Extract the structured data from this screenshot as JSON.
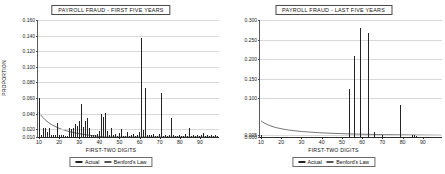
{
  "figure": {
    "background": "#ffffff",
    "series_color": "#242424",
    "grid_color": "#d9d9d9"
  },
  "charts": [
    {
      "id": "payroll-fraud-first-five-years",
      "title": "PAYROLL FRAUD - FIRST FIVE YEARS",
      "xlabel": "FIRST-TWO DIGITS",
      "ylabel": "PROPORTION",
      "legend": {
        "actual": "Actual",
        "benford": "Benford's Law",
        "position": "below-axis"
      },
      "yticks": [
        "0.160",
        "0.140",
        "0.120",
        "0.100",
        "0.080",
        "0.060",
        "0.040",
        "0.020",
        "0.010"
      ],
      "xticks": [
        "10",
        "20",
        "30",
        "40",
        "50",
        "60",
        "70",
        "80",
        "90"
      ]
    },
    {
      "id": "payroll-fraud-last-five-years",
      "title": "PAYROLL FRAUD - LAST FIVE YEARS",
      "xlabel": "FIRST-TWO DIGITS",
      "ylabel": "",
      "legend": {
        "actual": "Actual",
        "benford": "Benford's Law",
        "position": "below-axis"
      },
      "yticks": [
        "0.300",
        "0.250",
        "0.200",
        "0.150",
        "0.100",
        "0.005",
        "0.000"
      ],
      "xticks": [
        "10",
        "20",
        "30",
        "40",
        "50",
        "60",
        "70",
        "80",
        "90"
      ]
    }
  ],
  "chart_data": [
    {
      "type": "bar",
      "title": "PAYROLL FRAUD - FIRST FIVE YEARS",
      "xlabel": "FIRST-TWO DIGITS",
      "ylabel": "PROPORTION",
      "grid": true,
      "legend": [
        "Actual",
        "Benford's Law"
      ],
      "xlim": [
        10,
        99
      ],
      "ylim": [
        0.01,
        0.16
      ],
      "ytick_values": [
        0.16,
        0.14,
        0.12,
        0.1,
        0.08,
        0.06,
        0.04,
        0.02,
        0.01
      ],
      "xtick_values": [
        10,
        20,
        30,
        40,
        50,
        60,
        70,
        80,
        90
      ],
      "categories": [
        10,
        11,
        12,
        13,
        14,
        15,
        16,
        17,
        18,
        19,
        20,
        21,
        22,
        23,
        24,
        25,
        26,
        27,
        28,
        29,
        30,
        31,
        32,
        33,
        34,
        35,
        36,
        37,
        38,
        39,
        40,
        41,
        42,
        43,
        44,
        45,
        46,
        47,
        48,
        49,
        50,
        51,
        52,
        53,
        54,
        55,
        56,
        57,
        58,
        59,
        60,
        61,
        62,
        63,
        64,
        65,
        66,
        67,
        68,
        69,
        70,
        71,
        72,
        73,
        74,
        75,
        76,
        77,
        78,
        79,
        80,
        81,
        82,
        83,
        84,
        85,
        86,
        87,
        88,
        89,
        90,
        91,
        92,
        93,
        94,
        95,
        96,
        97,
        98,
        99
      ],
      "series": [
        {
          "name": "Actual",
          "type": "bar",
          "values": [
            0.06,
            0.012,
            0.021,
            0.022,
            0.016,
            0.021,
            0.012,
            0.013,
            0.013,
            0.028,
            0.013,
            0.012,
            0.012,
            0.011,
            0.011,
            0.022,
            0.02,
            0.021,
            0.027,
            0.024,
            0.03,
            0.052,
            0.023,
            0.03,
            0.035,
            0.021,
            0.013,
            0.013,
            0.013,
            0.014,
            0.018,
            0.039,
            0.036,
            0.041,
            0.018,
            0.013,
            0.022,
            0.013,
            0.014,
            0.011,
            0.015,
            0.02,
            0.011,
            0.011,
            0.016,
            0.011,
            0.013,
            0.014,
            0.011,
            0.012,
            0.016,
            0.137,
            0.019,
            0.073,
            0.013,
            0.013,
            0.013,
            0.014,
            0.011,
            0.011,
            0.014,
            0.066,
            0.011,
            0.012,
            0.011,
            0.013,
            0.034,
            0.012,
            0.011,
            0.011,
            0.012,
            0.011,
            0.011,
            0.014,
            0.011,
            0.021,
            0.011,
            0.013,
            0.011,
            0.012,
            0.011,
            0.012,
            0.015,
            0.011,
            0.012,
            0.011,
            0.013,
            0.011,
            0.012,
            0.011
          ]
        },
        {
          "name": "Benford's Law",
          "type": "line",
          "values": [
            0.0414,
            0.0378,
            0.0348,
            0.0322,
            0.03,
            0.028,
            0.0263,
            0.0248,
            0.0235,
            0.0223,
            0.0212,
            0.0202,
            0.0193,
            0.0185,
            0.0177,
            0.017,
            0.0164,
            0.0158,
            0.0152,
            0.0147,
            0.0142,
            0.0138,
            0.0134,
            0.013,
            0.0126,
            0.0122,
            0.0119,
            0.0116,
            0.0113,
            0.011,
            0.0107,
            0.0105,
            0.0102,
            0.01,
            0.0098,
            0.0095,
            0.0093,
            0.0091,
            0.009,
            0.0088,
            0.0086,
            0.0084,
            0.0083,
            0.0081,
            0.008,
            0.0078,
            0.0077,
            0.0076,
            0.0074,
            0.0073,
            0.0072,
            0.0071,
            0.007,
            0.0069,
            0.0068,
            0.0067,
            0.0066,
            0.0065,
            0.0064,
            0.0063,
            0.0062,
            0.0061,
            0.006,
            0.006,
            0.0059,
            0.0058,
            0.0057,
            0.0057,
            0.0056,
            0.0055,
            0.0055,
            0.0054,
            0.0053,
            0.0053,
            0.0052,
            0.0051,
            0.0051,
            0.005,
            0.005,
            0.0049,
            0.0048,
            0.0048,
            0.0047,
            0.0047,
            0.0046,
            0.0046,
            0.0045,
            0.0045,
            0.0044,
            0.0044
          ]
        }
      ]
    },
    {
      "type": "bar",
      "title": "PAYROLL FRAUD - LAST FIVE YEARS",
      "xlabel": "FIRST-TWO DIGITS",
      "ylabel": "",
      "grid": true,
      "legend": [
        "Actual",
        "Benford's Law"
      ],
      "xlim": [
        10,
        99
      ],
      "ylim": [
        0.0,
        0.3
      ],
      "ytick_values": [
        0.3,
        0.25,
        0.2,
        0.15,
        0.1,
        0.005,
        0.0
      ],
      "xtick_values": [
        10,
        20,
        30,
        40,
        50,
        60,
        70,
        80,
        90
      ],
      "categories": [
        10,
        11,
        12,
        13,
        14,
        15,
        16,
        17,
        18,
        19,
        20,
        21,
        22,
        23,
        24,
        25,
        26,
        27,
        28,
        29,
        30,
        31,
        32,
        33,
        34,
        35,
        36,
        37,
        38,
        39,
        40,
        41,
        42,
        43,
        44,
        45,
        46,
        47,
        48,
        49,
        50,
        51,
        52,
        53,
        54,
        55,
        56,
        57,
        58,
        59,
        60,
        61,
        62,
        63,
        64,
        65,
        66,
        67,
        68,
        69,
        70,
        71,
        72,
        73,
        74,
        75,
        76,
        77,
        78,
        79,
        80,
        81,
        82,
        83,
        84,
        85,
        86,
        87,
        88,
        89,
        90,
        91,
        92,
        93,
        94,
        95,
        96,
        97,
        98,
        99
      ],
      "series": [
        {
          "name": "Actual",
          "type": "bar",
          "values": [
            0.006,
            0.0,
            0.0,
            0.0,
            0.0,
            0.0,
            0.0,
            0.0,
            0.0,
            0.0,
            0.0,
            0.0,
            0.0,
            0.0,
            0.0,
            0.0,
            0.0,
            0.0,
            0.0,
            0.0,
            0.0,
            0.0,
            0.0,
            0.0,
            0.0,
            0.0,
            0.0,
            0.0,
            0.0,
            0.0,
            0.0,
            0.0,
            0.0,
            0.0,
            0.0,
            0.0,
            0.0,
            0.0,
            0.0,
            0.0,
            0.0,
            0.0,
            0.0,
            0.0,
            0.122,
            0.0,
            0.209,
            0.0,
            0.0,
            0.28,
            0.0,
            0.0,
            0.0,
            0.266,
            0.0,
            0.0,
            0.014,
            0.0,
            0.0,
            0.0,
            0.004,
            0.0,
            0.0,
            0.0,
            0.0,
            0.0,
            0.0,
            0.0,
            0.0,
            0.081,
            0.0,
            0.0,
            0.0,
            0.0,
            0.0,
            0.004,
            0.004,
            0.003,
            0.0,
            0.0,
            0.0,
            0.0,
            0.0,
            0.0,
            0.0,
            0.0,
            0.0,
            0.0,
            0.0,
            0.0
          ]
        },
        {
          "name": "Benford's Law",
          "type": "line",
          "values": [
            0.0414,
            0.0378,
            0.0348,
            0.0322,
            0.03,
            0.028,
            0.0263,
            0.0248,
            0.0235,
            0.0223,
            0.0212,
            0.0202,
            0.0193,
            0.0185,
            0.0177,
            0.017,
            0.0164,
            0.0158,
            0.0152,
            0.0147,
            0.0142,
            0.0138,
            0.0134,
            0.013,
            0.0126,
            0.0122,
            0.0119,
            0.0116,
            0.0113,
            0.011,
            0.0107,
            0.0105,
            0.0102,
            0.01,
            0.0098,
            0.0095,
            0.0093,
            0.0091,
            0.009,
            0.0088,
            0.0086,
            0.0084,
            0.0083,
            0.0081,
            0.008,
            0.0078,
            0.0077,
            0.0076,
            0.0074,
            0.0073,
            0.0072,
            0.0071,
            0.007,
            0.0069,
            0.0068,
            0.0067,
            0.0066,
            0.0065,
            0.0064,
            0.0063,
            0.0062,
            0.0061,
            0.006,
            0.006,
            0.0059,
            0.0058,
            0.0057,
            0.0057,
            0.0056,
            0.0055,
            0.0055,
            0.0054,
            0.0053,
            0.0053,
            0.0052,
            0.0051,
            0.0051,
            0.005,
            0.005,
            0.0049,
            0.0048,
            0.0048,
            0.0047,
            0.0047,
            0.0046,
            0.0046,
            0.0045,
            0.0045,
            0.0044,
            0.0044
          ]
        }
      ]
    }
  ]
}
